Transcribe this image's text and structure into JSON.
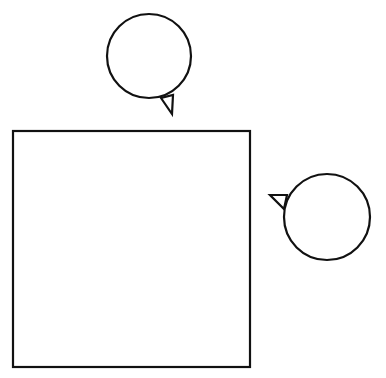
{
  "diagram": {
    "canvas": {
      "width": 386,
      "height": 378,
      "background": "#ffffff"
    },
    "stroke_color": "#111111",
    "square": {
      "x": 13,
      "y": 131,
      "width": 237,
      "height": 236
    },
    "bubbles": [
      {
        "id": "top",
        "cx": 149,
        "cy": 56,
        "r": 42,
        "tail": "161,98 172,114 173,95"
      },
      {
        "id": "right",
        "cx": 327,
        "cy": 217,
        "r": 43,
        "tail": "287,195 270,195 284,209"
      }
    ]
  }
}
